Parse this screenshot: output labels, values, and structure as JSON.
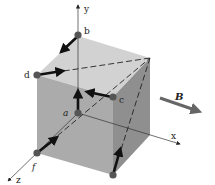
{
  "diagram": {
    "axes": {
      "x": "x",
      "y": "y",
      "z": "z"
    },
    "points": {
      "a": "a",
      "b": "b",
      "c": "c",
      "d": "d",
      "f": "f"
    },
    "field_label": "B",
    "colors": {
      "cube_front": "#a9a9a9",
      "cube_top": "#cfcfcf",
      "cube_right": "#8e8e8e",
      "point": "#555555",
      "arrow": "#111111",
      "field_arrow": "#666666"
    }
  }
}
